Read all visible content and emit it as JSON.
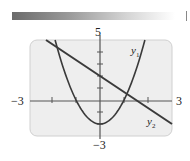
{
  "chart_data": {
    "type": "line",
    "title": "",
    "xlabel": "",
    "ylabel": "",
    "xlim": [
      -3,
      3
    ],
    "ylim": [
      -3,
      5
    ],
    "grid": false,
    "x_tick_step": 1,
    "y_tick_step": 1,
    "tick_labels": {
      "x_min": "−3",
      "x_max": "3",
      "y_max": "5",
      "y_min": "−3"
    },
    "series": [
      {
        "name": "y1",
        "label": "y",
        "subscript": "1",
        "kind": "parabola",
        "equation": "y = 2x^2 - 2",
        "points": [
          [
            -1.87,
            5
          ],
          [
            -1.5,
            2.5
          ],
          [
            -1,
            0
          ],
          [
            -0.5,
            -1.5
          ],
          [
            0,
            -2
          ],
          [
            0.5,
            -1.5
          ],
          [
            1,
            0
          ],
          [
            1.5,
            2.5
          ],
          [
            1.87,
            5
          ]
        ]
      },
      {
        "name": "y2",
        "label": "y",
        "subscript": "2",
        "kind": "line",
        "equation": "y = -(4/3)x + 2",
        "points": [
          [
            -2.25,
            5
          ],
          [
            0,
            2
          ],
          [
            1.5,
            0
          ],
          [
            3,
            -2
          ]
        ]
      }
    ]
  },
  "labels": {
    "x_min": "−3",
    "x_max": "3",
    "y_max": "5",
    "y_min": "−3",
    "y1_main": "y",
    "y1_sub": "1",
    "y2_main": "y",
    "y2_sub": "2"
  },
  "colors": {
    "frame_bg": "#eeeeee",
    "frame_border": "#cfcfcf",
    "curve": "#3a3a3a"
  }
}
